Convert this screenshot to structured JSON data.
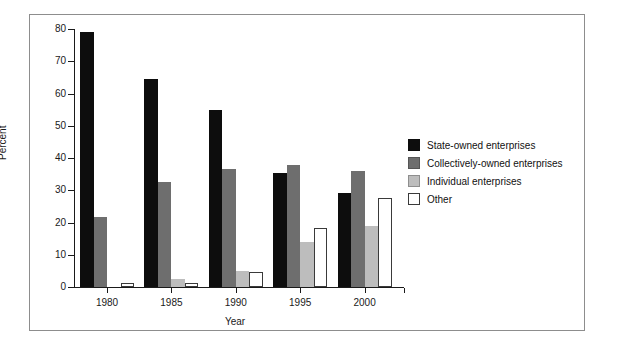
{
  "chart_data": {
    "type": "bar",
    "title": "",
    "xlabel": "Year",
    "ylabel": "Percent",
    "categories": [
      "1980",
      "1985",
      "1990",
      "1995",
      "2000"
    ],
    "ylim": [
      0,
      80
    ],
    "yticks": [
      0,
      10,
      20,
      30,
      40,
      50,
      60,
      70,
      80
    ],
    "grid": false,
    "legend_position": "right",
    "series": [
      {
        "name": "State-owned enterprises",
        "color": "#0d0d0d",
        "values": [
          79.0,
          64.4,
          55.0,
          35.3,
          29.2
        ]
      },
      {
        "name": "Collectively-owned enterprises",
        "color": "#6e6e6e",
        "values": [
          21.8,
          32.5,
          36.5,
          37.8,
          36.1
        ]
      },
      {
        "name": "Individual enterprises",
        "color": "#bdbdbd",
        "values": [
          0.0,
          2.5,
          5.0,
          14.0,
          19.0
        ]
      },
      {
        "name": "Other",
        "color": "#ffffff",
        "values": [
          1.3,
          1.4,
          4.7,
          18.3,
          27.5
        ]
      }
    ]
  },
  "legend": {
    "items": [
      {
        "label": "State-owned enterprises"
      },
      {
        "label": "Collectively-owned enterprises"
      },
      {
        "label": "Individual enterprises"
      },
      {
        "label": "Other"
      }
    ]
  }
}
